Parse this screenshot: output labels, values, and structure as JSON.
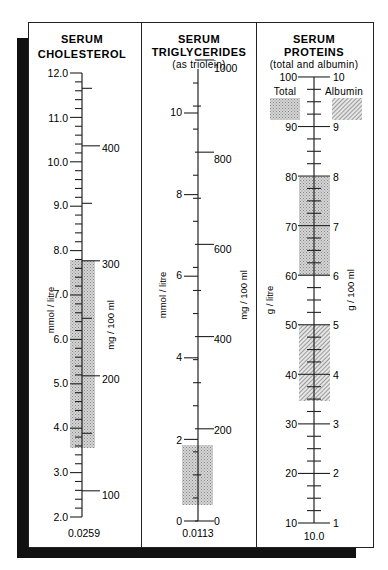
{
  "chart_data": {
    "type": "nomogram",
    "panels": [
      {
        "id": "cholesterol",
        "title_lines": [
          "SERUM",
          "CHOLESTEROL"
        ],
        "subtitle": "",
        "left_unit": "mmol / litre",
        "right_unit": "mg / 100 ml",
        "conversion_factor": "0.0259",
        "left_scale": {
          "min": 2.0,
          "max": 12.0,
          "major": [
            2.0,
            3.0,
            4.0,
            5.0,
            6.0,
            7.0,
            8.0,
            9.0,
            10.0,
            11.0,
            12.0
          ],
          "labels": [
            "2.0",
            "3.0",
            "4.0",
            "5.0",
            "6.0",
            "7.0",
            "8.0",
            "9.0",
            "10.0",
            "11.0",
            "12.0"
          ],
          "minor_step": 0.2
        },
        "right_scale": {
          "major": [
            100,
            200,
            300,
            400
          ],
          "labels": [
            "100",
            "200",
            "300",
            "400"
          ],
          "minor": [
            150,
            250,
            350,
            450
          ]
        },
        "shaded_ranges": [
          {
            "name": "reference range",
            "from_mmol": 3.6,
            "to_mmol": 7.8,
            "from_mg": 140,
            "to_mg": 300,
            "pattern": "stipple"
          }
        ]
      },
      {
        "id": "triglycerides",
        "title_lines": [
          "SERUM",
          "TRIGLYCERIDES"
        ],
        "subtitle": "(as triolein)",
        "left_unit": "mmol / litre",
        "right_unit": "mg / 100 ml",
        "conversion_factor": "0.0113",
        "left_scale": {
          "min": 0,
          "max": 11.3,
          "major": [
            0,
            2,
            4,
            6,
            8,
            10
          ],
          "labels": [
            "0",
            "2",
            "4",
            "6",
            "8",
            "10"
          ]
        },
        "right_scale": {
          "major": [
            0,
            200,
            400,
            600,
            800,
            1000
          ],
          "labels": [
            "0",
            "200",
            "400",
            "600",
            "800",
            "1000"
          ],
          "minor_step": 50
        },
        "shaded_ranges": [
          {
            "name": "reference range",
            "from_mmol": 0.4,
            "to_mmol": 1.85,
            "from_mg": 35,
            "to_mg": 165,
            "pattern": "stipple"
          }
        ]
      },
      {
        "id": "proteins",
        "title_lines": [
          "SERUM",
          "PROTEINS"
        ],
        "subtitle": "(total and albumin)",
        "left_unit": "g / litre",
        "right_unit": "g / 100 ml",
        "conversion_factor": "10.0",
        "left_scale": {
          "min": 10,
          "max": 100,
          "major": [
            10,
            20,
            30,
            40,
            50,
            60,
            70,
            80,
            90,
            100
          ],
          "labels": [
            "10",
            "20",
            "30",
            "40",
            "50",
            "60",
            "70",
            "80",
            "90",
            "100"
          ],
          "minor_step": 2.5
        },
        "right_scale": {
          "major": [
            1,
            2,
            3,
            4,
            5,
            6,
            7,
            8,
            9,
            10
          ],
          "labels": [
            "1",
            "2",
            "3",
            "4",
            "5",
            "6",
            "7",
            "8",
            "9",
            "10"
          ]
        },
        "legend": [
          {
            "label": "Total",
            "pattern": "stipple"
          },
          {
            "label": "Albumin",
            "pattern": "hatch"
          }
        ],
        "shaded_ranges": [
          {
            "name": "Total",
            "from_g_l": 60,
            "to_g_l": 80,
            "pattern": "stipple"
          },
          {
            "name": "Albumin",
            "from_g_l": 35,
            "to_g_l": 50,
            "pattern": "hatch"
          }
        ]
      }
    ],
    "grid": false,
    "legend_position": "top of proteins panel"
  },
  "labels": {
    "chol": {
      "t1": "SERUM",
      "t2": "CHOLESTEROL",
      "left_unit": "mmol / litre",
      "right_unit": "mg / 100 ml",
      "factor": "0.0259",
      "l": [
        "12.0",
        "11.0",
        "10.0",
        "9.0",
        "8.0",
        "7.0",
        "6.0",
        "5.0",
        "4.0",
        "3.0",
        "2.0"
      ],
      "r": [
        "400",
        "300",
        "200",
        "100"
      ]
    },
    "trig": {
      "t1": "SERUM",
      "t2": "TRIGLYCERIDES",
      "t3": "(as triolein)",
      "left_unit": "mmol / litre",
      "right_unit": "mg / 100 ml",
      "factor": "0.0113",
      "l": [
        "10",
        "8",
        "6",
        "4",
        "2",
        "0"
      ],
      "r": [
        "1000",
        "800",
        "600",
        "400",
        "200",
        "0"
      ]
    },
    "prot": {
      "t1": "SERUM",
      "t2": "PROTEINS",
      "t3": "(total and albumin)",
      "left_unit": "g / litre",
      "right_unit": "g / 100 ml",
      "factor": "10.0",
      "legend_total": "Total",
      "legend_albumin": "Albumin",
      "l": [
        "100",
        "90",
        "80",
        "70",
        "60",
        "50",
        "40",
        "30",
        "20",
        "10"
      ],
      "r": [
        "10",
        "9",
        "8",
        "7",
        "6",
        "5",
        "4",
        "3",
        "2",
        "1"
      ]
    }
  }
}
